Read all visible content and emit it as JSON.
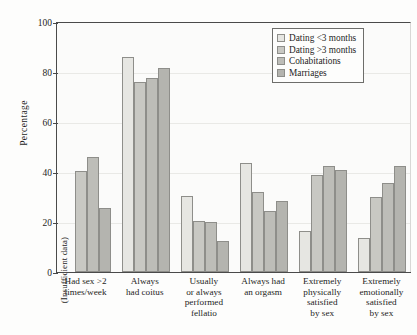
{
  "chart_data": {
    "type": "bar",
    "title": "",
    "xlabel": "",
    "ylabel": "Percentage",
    "ylim": [
      0,
      100
    ],
    "yticks": [
      0,
      20,
      40,
      60,
      80,
      100
    ],
    "grid": true,
    "legend_position": "top-right",
    "categories": [
      "Had sex >2 times/week",
      "Always had coitus",
      "Usually or always performed fellatio",
      "Always had an orgasm",
      "Extremely physically satisfied by sex",
      "Extremely emotionally satisfied by sex"
    ],
    "category_lines": [
      [
        "Had sex >2",
        "times/week"
      ],
      [
        "Always",
        "had coitus"
      ],
      [
        "Usually",
        "or always",
        "performed",
        "fellatio"
      ],
      [
        "Always had",
        "an orgasm"
      ],
      [
        "Extremely",
        "physically",
        "satisfied",
        "by sex"
      ],
      [
        "Extremely",
        "emotionally",
        "satisfied",
        "by sex"
      ]
    ],
    "series": [
      {
        "name": "Dating <3 months",
        "values": [
          null,
          86.0,
          30.5,
          43.5,
          16.5,
          13.5
        ]
      },
      {
        "name": "Dating >3 months",
        "values": [
          40.5,
          76.0,
          20.5,
          32.0,
          39.0,
          30.0
        ]
      },
      {
        "name": "Cohabitations",
        "values": [
          46.0,
          77.5,
          20.0,
          24.5,
          42.5,
          35.5
        ]
      },
      {
        "name": "Marriages",
        "values": [
          25.5,
          81.5,
          12.5,
          28.5,
          41.0,
          42.5
        ]
      }
    ],
    "annotations": [
      {
        "text": "(Insufficient data)",
        "category": "Had sex >2 times/week",
        "series": "Dating <3 months",
        "orientation": "vertical"
      }
    ],
    "series_colors": [
      "#e6e6e2",
      "#c8c8c3",
      "#bdbdb8",
      "#b4b4af"
    ],
    "bar_edge_color": "#8e8e8a",
    "axis_color": "#4a4a4a",
    "grid_color": "#e9e9e6"
  },
  "legend": {
    "entries": [
      "Dating <3 months",
      "Dating >3 months",
      "Cohabitations",
      "Marriages"
    ]
  },
  "axes": {
    "y_title": "Percentage",
    "y_tick_labels": [
      "0",
      "20",
      "40",
      "60",
      "80",
      "100"
    ]
  }
}
